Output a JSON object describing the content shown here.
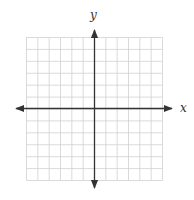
{
  "diagram": {
    "type": "coordinate-grid",
    "x_axis_label": "x",
    "y_axis_label": "y",
    "grid": {
      "columns": 12,
      "rows": 12,
      "origin_col": 6,
      "origin_row": 6
    },
    "colors": {
      "grid": "#d0d0d0",
      "axis": "#333333",
      "background": "#ffffff"
    }
  }
}
